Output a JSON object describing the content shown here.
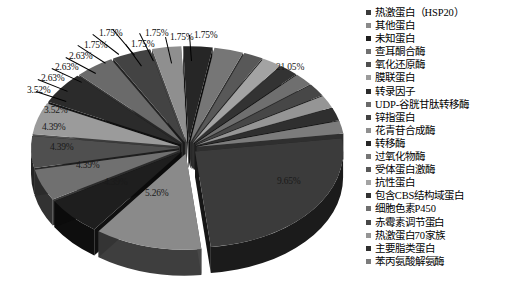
{
  "chart_data": {
    "type": "pie",
    "title": "",
    "subtitle": "",
    "xlabel": "",
    "ylabel": "",
    "legend_position": "right",
    "grid": false,
    "value_suffix": "%",
    "categories": [
      "热激蛋白（HSP20）",
      "其他蛋白",
      "未知蛋白",
      "查耳酮合酶",
      "氧化还原酶",
      "膜联蛋白",
      "转录因子",
      "UDP-谷胱甘肽转移酶",
      "锌指蛋白",
      "花青苷合成酶",
      "转移酶",
      "过氧化物酶",
      "受体蛋白激酶",
      "抗性蛋白",
      "包含CBS结构域蛋白",
      "细胞色素P450",
      "赤霉素调节蛋白",
      "热激蛋白70家族",
      "主要脂类蛋白",
      "苯丙氨酸解氨酶"
    ],
    "values": [
      21.05,
      9.65,
      5.26,
      4.39,
      4.39,
      4.39,
      4.39,
      3.52,
      3.52,
      2.63,
      2.63,
      2.63,
      1.75,
      1.75,
      1.75,
      1.75,
      1.75,
      1.75,
      1.75,
      1.75
    ],
    "labels": [
      "21.05%",
      "9.65%",
      "5.26%",
      "4.39%",
      "4.39%",
      "4.39%",
      "4.39%",
      "3.52%",
      "3.52%",
      "2.63%",
      "2.63%",
      "2.63%",
      "1.75%",
      "1.75%",
      "1.75%",
      "1.75%",
      "1.75%",
      "1.75%",
      "1.75%",
      "1.75%"
    ],
    "colors": [
      "#3b3b3b",
      "#8a8a8a",
      "#1e1e1e",
      "#707070",
      "#4f4f4f",
      "#9b9b9b",
      "#2b2b2b",
      "#6a6a6a",
      "#434343",
      "#8f8f8f",
      "#262626",
      "#767676",
      "#585858",
      "#a3a3a3",
      "#333333",
      "#6f6f6f",
      "#474747",
      "#959595",
      "#2f2f2f",
      "#7c7c7c"
    ]
  },
  "legend": {
    "items": [
      {
        "label": "热激蛋白（HSP20）",
        "color": "#3b3b3b"
      },
      {
        "label": "其他蛋白",
        "color": "#8a8a8a"
      },
      {
        "label": "未知蛋白",
        "color": "#1e1e1e"
      },
      {
        "label": "查耳酮合酶",
        "color": "#707070"
      },
      {
        "label": "氧化还原酶",
        "color": "#4f4f4f"
      },
      {
        "label": "膜联蛋白",
        "color": "#9b9b9b"
      },
      {
        "label": "转录因子",
        "color": "#2b2b2b"
      },
      {
        "label": "UDP-谷胱甘肽转移酶",
        "color": "#6a6a6a"
      },
      {
        "label": "锌指蛋白",
        "color": "#434343"
      },
      {
        "label": "花青苷合成酶",
        "color": "#8f8f8f"
      },
      {
        "label": "转移酶",
        "color": "#262626"
      },
      {
        "label": "过氧化物酶",
        "color": "#767676"
      },
      {
        "label": "受体蛋白激酶",
        "color": "#585858"
      },
      {
        "label": "抗性蛋白",
        "color": "#a3a3a3"
      },
      {
        "label": "包含CBS结构域蛋白",
        "color": "#333333"
      },
      {
        "label": "细胞色素P450",
        "color": "#6f6f6f"
      },
      {
        "label": "赤霉素调节蛋白",
        "color": "#474747"
      },
      {
        "label": "热激蛋白70家族",
        "color": "#959595"
      },
      {
        "label": "主要脂类蛋白",
        "color": "#2f2f2f"
      },
      {
        "label": "苯丙氨酸解氨酶",
        "color": "#7c7c7c"
      }
    ]
  },
  "callouts": [
    {
      "text": "21.05%",
      "x": 276,
      "y": 62,
      "style": "onslice"
    },
    {
      "text": "9.65%",
      "x": 277,
      "y": 176,
      "style": "onslice"
    },
    {
      "text": "5.26%",
      "x": 145,
      "y": 188,
      "style": "onslice"
    },
    {
      "text": "4.39%",
      "x": 104,
      "y": 177,
      "style": "onslice"
    },
    {
      "text": "4.39%",
      "x": 76,
      "y": 160,
      "style": "onslice"
    },
    {
      "text": "4.39%",
      "x": 50,
      "y": 142,
      "style": "onslice"
    },
    {
      "text": "4.39%",
      "x": 42,
      "y": 122,
      "style": "onslice"
    },
    {
      "text": "3.52%",
      "x": 44,
      "y": 105,
      "style": "onslice"
    },
    {
      "text": "3.52%",
      "x": 27,
      "y": 85,
      "style": "outside"
    },
    {
      "text": "2.63%",
      "x": 41,
      "y": 73,
      "style": "outside"
    },
    {
      "text": "2.63%",
      "x": 55,
      "y": 62,
      "style": "outside"
    },
    {
      "text": "2.63%",
      "x": 69,
      "y": 51,
      "style": "outside"
    },
    {
      "text": "1.75%",
      "x": 84,
      "y": 40,
      "style": "outside"
    },
    {
      "text": "1.75%",
      "x": 99,
      "y": 28,
      "style": "outside"
    },
    {
      "text": "1.75%",
      "x": 131,
      "y": 39,
      "style": "outside"
    },
    {
      "text": "1.75%",
      "x": 145,
      "y": 28,
      "style": "outside"
    },
    {
      "text": "1.75%",
      "x": 170,
      "y": 32,
      "style": "outside"
    },
    {
      "text": "1.75%",
      "x": 194,
      "y": 30,
      "style": "outside"
    }
  ]
}
